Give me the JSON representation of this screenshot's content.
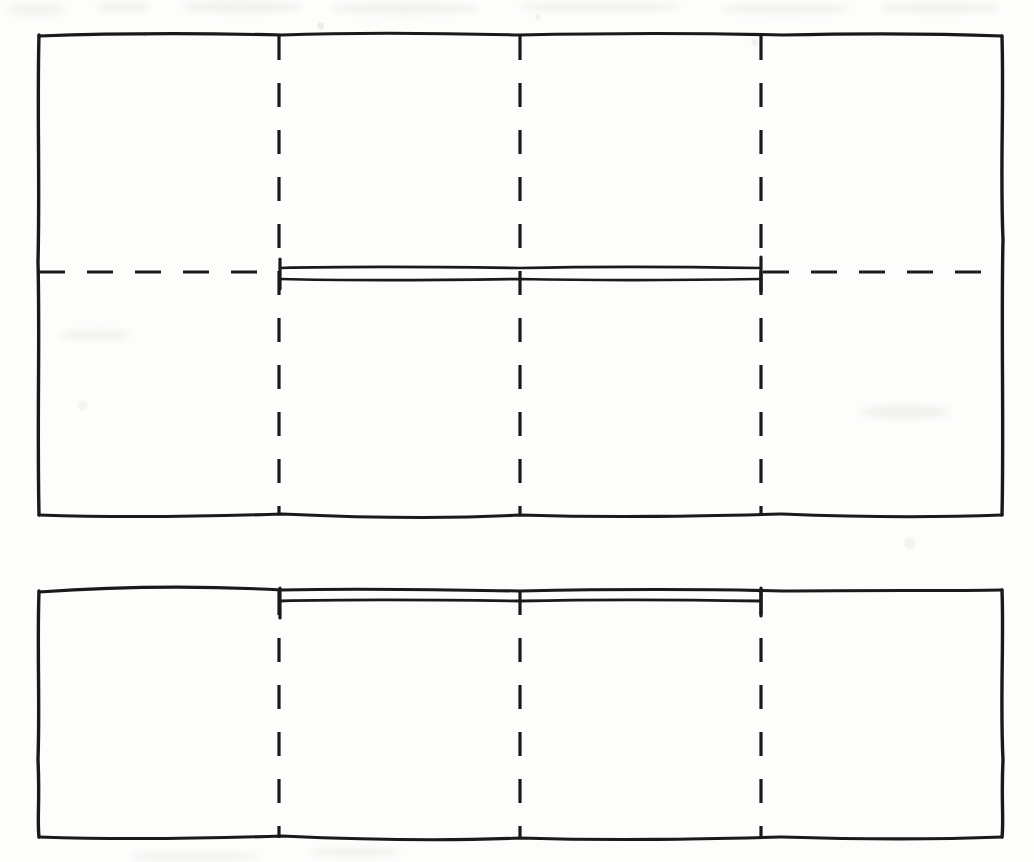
{
  "figure": {
    "kind": "hand-drawn-scan",
    "title_text": "",
    "caption_text": "",
    "background_color": "#fdfdfc",
    "ink_color": "#1a1a1a",
    "canvas": {
      "width": 1034,
      "height": 862
    }
  },
  "chart_data": {
    "type": "diagram",
    "title": "",
    "xlabel": "",
    "ylabel": "",
    "panels": [
      {
        "name": "upper-rectangle",
        "x": 38,
        "y": 34,
        "width": 964,
        "height": 482,
        "divisions": 4,
        "vertical_dashed_x": [
          279,
          520,
          761
        ],
        "horizontal_dashed_y": 272,
        "bar": {
          "x1": 279,
          "x2": 761,
          "y": 273,
          "span_panels": [
            2,
            3
          ]
        }
      },
      {
        "name": "lower-rectangle",
        "x": 38,
        "y": 590,
        "width": 964,
        "height": 248,
        "divisions": 4,
        "vertical_dashed_x": [
          279,
          520,
          761
        ],
        "horizontal_dashed_y": null,
        "bar": {
          "x1": 279,
          "x2": 761,
          "y": 601,
          "span_panels": [
            2,
            3
          ]
        }
      }
    ],
    "grid": false,
    "legend": null
  },
  "elements": {
    "upper_rect_label": "upper rectangle outline",
    "lower_rect_label": "lower rectangle outline",
    "centerline_label": "horizontal centerline",
    "divider_label": "vertical divider",
    "bar_label": "span bar"
  }
}
